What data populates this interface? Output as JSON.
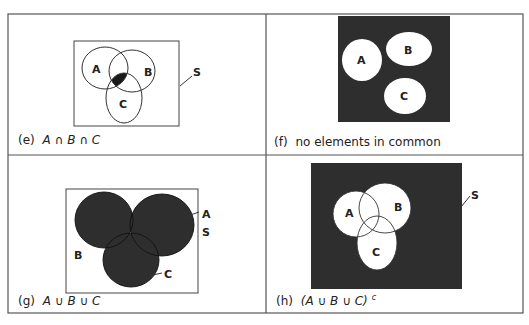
{
  "figure": {
    "colors": {
      "ink": "#222222",
      "fill_dark": "#2e2e2e",
      "paper": "#ffffff",
      "frame": "#555555"
    },
    "panels": [
      {
        "id": "e",
        "caption_prefix": "(e)",
        "caption_expr": "A ∩ B ∩ C",
        "labels": {
          "A": "A",
          "B": "B",
          "C": "C",
          "S": "S"
        },
        "shaded_region": "A ∩ B ∩ C"
      },
      {
        "id": "f",
        "caption_prefix": "(f)",
        "caption_expr": "no elements in common",
        "labels": {
          "A": "A",
          "B": "B",
          "C": "C"
        },
        "shaded_region": "complement of A, B, C (disjoint sets)"
      },
      {
        "id": "g",
        "caption_prefix": "(g)",
        "caption_expr": "A ∪ B ∪ C",
        "labels": {
          "A": "A",
          "B": "B",
          "C": "C",
          "S": "S"
        },
        "shaded_region": "A ∪ B ∪ C"
      },
      {
        "id": "h",
        "caption_prefix": "(h)",
        "caption_expr": "(A ∪ B ∪ C)",
        "caption_sup": "c",
        "labels": {
          "A": "A",
          "B": "B",
          "C": "C",
          "S": "S"
        },
        "shaded_region": "(A ∪ B ∪ C)^c"
      }
    ]
  }
}
